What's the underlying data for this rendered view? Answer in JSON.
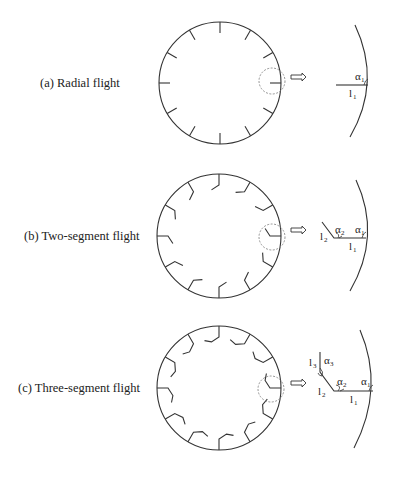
{
  "panels": [
    {
      "id": "a",
      "label": "(a) Radial flight",
      "segments": 1,
      "blade_count": 12,
      "detail_labels": {
        "alpha1": "α",
        "alpha1_sub": "1",
        "l1": "l",
        "l1_sub": "1"
      }
    },
    {
      "id": "b",
      "label": "(b) Two-segment flight",
      "segments": 2,
      "blade_count": 12,
      "detail_labels": {
        "alpha1": "α",
        "alpha1_sub": "1",
        "alpha2": "α",
        "alpha2_sub": "2",
        "l1": "l",
        "l1_sub": "1",
        "l2": "l",
        "l2_sub": "2"
      }
    },
    {
      "id": "c",
      "label": "(c)  Three-segment flight",
      "segments": 3,
      "blade_count": 12,
      "detail_labels": {
        "alpha1": "α",
        "alpha1_sub": "1",
        "alpha2": "α",
        "alpha2_sub": "2",
        "alpha3": "α",
        "alpha3_sub": "3",
        "l1": "l",
        "l1_sub": "1",
        "l2": "l",
        "l2_sub": "2",
        "l3": "l",
        "l3_sub": "3"
      }
    }
  ],
  "icons": {
    "arrow": "hollow-right-arrow-icon",
    "zoom_marker": "dashed-circle-icon"
  },
  "colors": {
    "stroke": "#333333",
    "dashed": "#888888",
    "background": "#ffffff"
  }
}
